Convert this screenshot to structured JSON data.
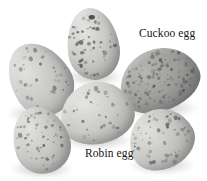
{
  "image": {
    "subject": "five bird eggs on white background",
    "background_color": "#ffffff",
    "label_color": "#151515"
  },
  "labels": [
    {
      "id": "cuckoo",
      "text": "Cuckoo egg",
      "x": 139,
      "y": 28
    },
    {
      "id": "robin",
      "text": "Robin egg",
      "x": 85,
      "y": 148
    }
  ],
  "eggs": [
    {
      "id": "top-left-egg",
      "name": "robin-egg-top-left",
      "x": 10,
      "y": 41,
      "w": 60,
      "h": 76,
      "rotate": -32,
      "base_color": "#c8c8c6",
      "highlight_color": "#e2e2df",
      "shade_color": "#9a9a98",
      "speckle_density": "low",
      "shadow": {
        "x": 8,
        "y": 104,
        "w": 64,
        "h": 20
      }
    },
    {
      "id": "top-center-egg",
      "name": "robin-egg-top-center",
      "x": 67,
      "y": 8,
      "w": 52,
      "h": 72,
      "rotate": -8,
      "base_color": "#c9c9c6",
      "highlight_color": "#e4e4e1",
      "shade_color": "#9c9c99",
      "speckle_density": "medium",
      "has_dark_spot": true,
      "shadow": {
        "x": 66,
        "y": 68,
        "w": 56,
        "h": 18
      }
    },
    {
      "id": "cuckoo-egg",
      "name": "cuckoo-egg",
      "x": 118,
      "y": 49,
      "w": 82,
      "h": 62,
      "rotate": -22,
      "base_color": "#9d9e9b",
      "highlight_color": "#b6b7b3",
      "shade_color": "#6f7170",
      "speckle_density": "high",
      "shadow": {
        "x": 120,
        "y": 98,
        "w": 78,
        "h": 20
      }
    },
    {
      "id": "center-egg",
      "name": "robin-egg-center",
      "x": 60,
      "y": 82,
      "w": 74,
      "h": 62,
      "rotate": -12,
      "base_color": "#cbcbc8",
      "highlight_color": "#e5e5e2",
      "shade_color": "#9d9d9a",
      "speckle_density": "low",
      "shadow": {
        "x": 62,
        "y": 131,
        "w": 70,
        "h": 18
      }
    },
    {
      "id": "bottom-left-egg",
      "name": "robin-egg-bottom-left",
      "x": 13,
      "y": 106,
      "w": 56,
      "h": 68,
      "rotate": -18,
      "base_color": "#c7c7c4",
      "highlight_color": "#e2e2df",
      "shade_color": "#9a9a97",
      "speckle_density": "medium",
      "shadow": {
        "x": 12,
        "y": 160,
        "w": 60,
        "h": 18
      }
    },
    {
      "id": "bottom-right-egg",
      "name": "robin-egg-bottom-right",
      "x": 128,
      "y": 109,
      "w": 66,
      "h": 60,
      "rotate": -28,
      "base_color": "#c6c6c3",
      "highlight_color": "#e1e1de",
      "shade_color": "#989896",
      "speckle_density": "medium",
      "shadow": {
        "x": 130,
        "y": 156,
        "w": 64,
        "h": 18
      }
    }
  ]
}
